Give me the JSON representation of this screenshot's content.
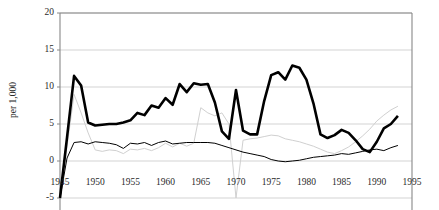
{
  "chart_data": {
    "type": "line",
    "title": "",
    "xlabel": "",
    "ylabel": "per 1,000",
    "xlim": [
      1945,
      1995
    ],
    "ylim": [
      -5,
      20
    ],
    "grid": true,
    "legend": "none",
    "x_ticks": [
      "1945",
      "1950",
      "1955",
      "1960",
      "1965",
      "1970",
      "1975",
      "1980",
      "1985",
      "1990",
      "1995"
    ],
    "y_ticks": [
      "-5",
      "0",
      "5",
      "10",
      "15",
      "20"
    ],
    "x": [
      1945,
      1946,
      1947,
      1948,
      1949,
      1950,
      1951,
      1952,
      1953,
      1954,
      1955,
      1956,
      1957,
      1958,
      1959,
      1960,
      1961,
      1962,
      1963,
      1964,
      1965,
      1966,
      1967,
      1968,
      1969,
      1970,
      1971,
      1972,
      1973,
      1974,
      1975,
      1976,
      1977,
      1978,
      1979,
      1980,
      1981,
      1982,
      1983,
      1984,
      1985,
      1986,
      1987,
      1988,
      1989,
      1990,
      1991,
      1992,
      1993
    ],
    "series": [
      {
        "name": "thick-black-series",
        "style": "thick-black",
        "values": [
          -5.0,
          3.2,
          11.5,
          10.2,
          5.2,
          4.8,
          4.9,
          5.0,
          5.0,
          5.2,
          5.5,
          6.5,
          6.2,
          7.5,
          7.2,
          8.5,
          7.6,
          10.4,
          9.3,
          10.5,
          10.3,
          10.4,
          7.9,
          4.0,
          3.0,
          9.6,
          4.1,
          3.6,
          3.6,
          8.1,
          11.6,
          12.0,
          11.0,
          12.9,
          12.6,
          11.0,
          7.8,
          3.6,
          3.1,
          3.5,
          4.2,
          3.8,
          2.8,
          1.6,
          1.2,
          2.6,
          4.4,
          5.0,
          6.1
        ]
      },
      {
        "name": "thin-black-series",
        "style": "thin-black",
        "values": [
          -5.0,
          0.4,
          2.5,
          2.6,
          2.3,
          2.6,
          2.5,
          2.4,
          2.2,
          1.7,
          2.4,
          2.3,
          2.5,
          2.1,
          2.5,
          2.7,
          2.3,
          2.4,
          2.5,
          2.5,
          2.5,
          2.5,
          2.4,
          2.1,
          1.8,
          1.5,
          1.2,
          1.0,
          0.8,
          0.6,
          0.2,
          0.0,
          -0.1,
          0.0,
          0.1,
          0.3,
          0.5,
          0.6,
          0.7,
          0.8,
          1.0,
          0.9,
          1.1,
          1.3,
          1.5,
          1.6,
          1.4,
          1.8,
          2.1
        ]
      },
      {
        "name": "faint-gray-series",
        "style": "faint-gray",
        "values": [
          -5.0,
          2.0,
          9.0,
          6.5,
          3.8,
          1.5,
          1.3,
          1.5,
          1.4,
          1.0,
          1.6,
          1.5,
          1.7,
          1.4,
          1.8,
          2.4,
          1.9,
          2.4,
          2.0,
          2.4,
          7.2,
          6.5,
          6.1,
          6.5,
          5.0,
          -5.0,
          2.8,
          3.0,
          3.1,
          3.3,
          3.5,
          3.4,
          3.0,
          2.8,
          2.6,
          2.3,
          2.0,
          1.6,
          1.2,
          1.0,
          1.4,
          1.9,
          2.6,
          3.4,
          4.3,
          5.4,
          6.2,
          6.9,
          7.4
        ]
      }
    ],
    "colors": {
      "thick_black": "#000000",
      "thin_black": "#000000",
      "faint_gray": "#d0d0d0",
      "grid": "#c8c8c8",
      "axis": "#888888",
      "text": "#2a2a2a",
      "background": "#ffffff"
    },
    "plot_area": {
      "left": 60,
      "right": 412,
      "top": 13,
      "bottom": 198
    }
  }
}
